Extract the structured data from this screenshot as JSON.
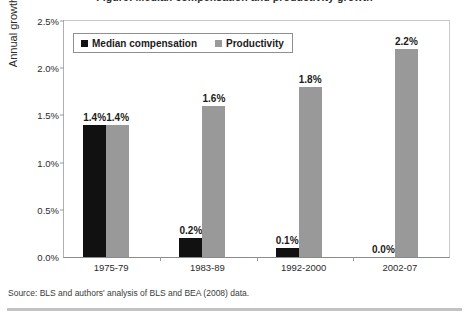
{
  "figure": {
    "title": "Figure: Median compensation and productivity growth",
    "y_axis_title": "Annual growth",
    "source_note": "Source: BLS and authors' analysis of BLS and BEA (2008) data."
  },
  "legend": {
    "entries": [
      {
        "label": "Median compensation",
        "color": "#111111"
      },
      {
        "label": "Productivity",
        "color": "#999999"
      }
    ]
  },
  "chart_data": {
    "type": "bar",
    "title": "Figure: Median compensation and productivity growth",
    "xlabel": "",
    "ylabel": "Annual growth",
    "ylim": [
      0,
      2.5
    ],
    "ytick_labels": [
      "0.0%",
      "0.5%",
      "1.0%",
      "1.5%",
      "2.0%",
      "2.5%"
    ],
    "ytick_values": [
      0,
      0.5,
      1.0,
      1.5,
      2.0,
      2.5
    ],
    "grid": false,
    "legend_position": "top-left-inside",
    "categories": [
      "1975-79",
      "1983-89",
      "1992-2000",
      "2002-07"
    ],
    "series": [
      {
        "name": "Median compensation",
        "color": "#111111",
        "values": [
          1.4,
          0.2,
          0.1,
          0.0
        ],
        "labels": [
          "1.4%",
          "0.2%",
          "0.1%",
          "0.0%"
        ]
      },
      {
        "name": "Productivity",
        "color": "#999999",
        "values": [
          1.4,
          1.6,
          1.8,
          2.2
        ],
        "labels": [
          "1.4%",
          "1.6%",
          "1.8%",
          "2.2%"
        ]
      }
    ]
  }
}
